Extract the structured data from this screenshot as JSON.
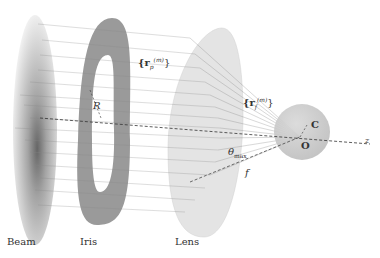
{
  "labels": {
    "beam": "Beam",
    "iris": "Iris",
    "lens": "Lens",
    "rp": "{r",
    "rp_sub": "p",
    "rp_sup": "(m)",
    "rp_close": "}",
    "rf": "{r",
    "rf_sub": "f",
    "rf_sup": "(m)",
    "rf_close": "}",
    "radius": "R",
    "theta": "θ",
    "theta_sub": "max",
    "focal": "f",
    "center": "C",
    "origin": "O",
    "axis": "z"
  },
  "colors": {
    "iris": "#9a9a9a",
    "lens": "#e2e2e2",
    "sphere": "#c8c8c8",
    "rays": "#888888",
    "beam_core": "#555555"
  }
}
